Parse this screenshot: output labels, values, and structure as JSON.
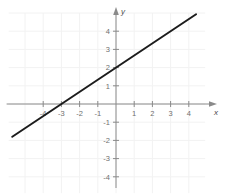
{
  "chart_data": {
    "type": "line",
    "title": "",
    "subtitle": "",
    "xlabel": "x",
    "ylabel": "y",
    "xlim": [
      -5.9,
      4.9
    ],
    "ylim": [
      -4.9,
      5.0
    ],
    "grid": true,
    "legend": null,
    "xticks": [
      -4,
      -3,
      -2,
      -1,
      1,
      2,
      3,
      4
    ],
    "yticks": [
      4,
      3,
      2,
      1,
      -1,
      -2,
      -3,
      -4
    ],
    "xtick_labels": [
      "-4",
      "-3",
      "-2",
      "-1",
      "1",
      "2",
      "3",
      "4"
    ],
    "ytick_labels": [
      "4",
      "3",
      "2",
      "1",
      "-1",
      "-2",
      "-3",
      "-4"
    ],
    "series": [
      {
        "name": "line",
        "equation": "y = (2/3)x + 2",
        "slope": 0.6667,
        "intercept": 2,
        "x_intercept": -3,
        "color": "#1c1c1c",
        "x": [
          -5.7,
          4.4
        ],
        "values": [
          -1.8,
          4.93
        ],
        "points": [
          {
            "x": -5.7,
            "y": -1.8
          },
          {
            "x": -3,
            "y": 0
          },
          {
            "x": 0,
            "y": 2
          },
          {
            "x": 3,
            "y": 4
          },
          {
            "x": 4.4,
            "y": 4.93
          }
        ]
      }
    ]
  },
  "axes": {
    "x_axis_label": "x",
    "y_axis_label": "y"
  },
  "colors": {
    "background": "#ffffff",
    "grid": "#f2f2f2",
    "axis": "#8a8a8a",
    "tick_text": "#6f6f6f",
    "line": "#1c1c1c"
  }
}
